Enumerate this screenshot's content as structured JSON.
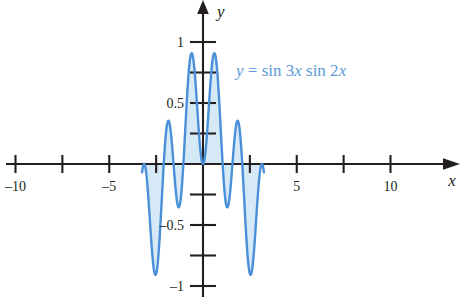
{
  "figure": {
    "name": "trig-product-plot",
    "background_color": "#ffffff"
  },
  "equation_label": {
    "text": "y = sin 3x sin 2x",
    "color": "#5b9bd5",
    "parts": {
      "y": "y",
      "equals": " = ",
      "sin1": "sin 3",
      "x1": "x",
      "space": " ",
      "sin2": "sin 2",
      "x2": "x"
    }
  },
  "axes": {
    "x_axis_name": "x",
    "y_axis_name": "y",
    "x_labels": [
      "–10",
      "–5",
      "5",
      "10"
    ],
    "y_labels": [
      "1",
      "0.5",
      "–0.5",
      "–1"
    ],
    "axis_color": "#231f20"
  },
  "chart_data": {
    "type": "line",
    "title": "",
    "xlabel": "x",
    "ylabel": "y",
    "expression": "y = sin 3x sin 2x",
    "series": [
      {
        "name": "y = sin 3x sin 2x",
        "stroke_color": "#4a90d9",
        "fill_color": "#d6e9f7",
        "fill_to": 0,
        "x_domain": [
          -3.25,
          3.25
        ],
        "x": [
          -3.25,
          -3.2,
          -3.15,
          -3.1,
          -3.05,
          -3.0,
          -2.95,
          -2.9,
          -2.85,
          -2.8,
          -2.75,
          -2.7,
          -2.65,
          -2.6,
          -2.55,
          -2.5,
          -2.45,
          -2.4,
          -2.35,
          -2.3,
          -2.25,
          -2.2,
          -2.15,
          -2.1,
          -2.05,
          -2.0,
          -1.95,
          -1.9,
          -1.85,
          -1.8,
          -1.75,
          -1.7,
          -1.65,
          -1.6,
          -1.55,
          -1.5,
          -1.45,
          -1.4,
          -1.35,
          -1.3,
          -1.25,
          -1.2,
          -1.15,
          -1.1,
          -1.05,
          -1.0,
          -0.95,
          -0.9,
          -0.85,
          -0.8,
          -0.75,
          -0.7,
          -0.65,
          -0.6,
          -0.55,
          -0.5,
          -0.45,
          -0.4,
          -0.35,
          -0.3,
          -0.25,
          -0.2,
          -0.15,
          -0.1,
          -0.05,
          0.0,
          0.05,
          0.1,
          0.15,
          0.2,
          0.25,
          0.3,
          0.35,
          0.4,
          0.45,
          0.5,
          0.55,
          0.6,
          0.65,
          0.7,
          0.75,
          0.8,
          0.85,
          0.9,
          0.95,
          1.0,
          1.05,
          1.1,
          1.15,
          1.2,
          1.25,
          1.3,
          1.35,
          1.4,
          1.45,
          1.5,
          1.55,
          1.6,
          1.65,
          1.7,
          1.75,
          1.8,
          1.85,
          1.9,
          1.95,
          2.0,
          2.05,
          2.1,
          2.15,
          2.2,
          2.25,
          2.3,
          2.35,
          2.4,
          2.45,
          2.5,
          2.55,
          2.6,
          2.65,
          2.7,
          2.75,
          2.8,
          2.85,
          2.9,
          2.95,
          3.0,
          3.05,
          3.1,
          3.15,
          3.2,
          3.25
        ],
        "y_note": "values computed as sin(3x)*sin(2x)"
      }
    ],
    "xlim": [
      -11.5,
      11.5
    ],
    "ylim": [
      -1.12,
      1.12
    ],
    "x_ticks": [
      -10,
      -7.5,
      -5,
      -2.5,
      2.5,
      5,
      7.5,
      10
    ],
    "x_tick_labels": {
      "-10": "–10",
      "-5": "–5",
      "5": "5",
      "10": "10"
    },
    "y_ticks": [
      -1,
      -0.75,
      -0.5,
      -0.25,
      0.25,
      0.5,
      0.75,
      1
    ],
    "y_tick_labels": {
      "1": "1",
      "0.5": "0.5",
      "-0.5": "–0.5",
      "-1": "–1"
    },
    "grid": false,
    "legend": "none",
    "annotations": [
      {
        "text": "y = sin 3x sin 2x",
        "x": 4.2,
        "y": 0.82,
        "color": "#5b9bd5"
      }
    ]
  }
}
